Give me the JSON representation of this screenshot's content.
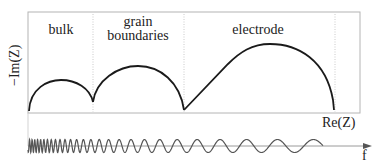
{
  "diagram": {
    "type": "impedance-spectrum-schematic",
    "axes": {
      "y_label": "−Im(Z)",
      "x_label": "Re(Z)",
      "frequency_label": "f"
    },
    "regions": [
      {
        "id": "bulk",
        "label": "bulk"
      },
      {
        "id": "grain-boundaries",
        "label_line1": "grain",
        "label_line2": "boundaries"
      },
      {
        "id": "electrode",
        "label": "electrode"
      }
    ],
    "colors": {
      "curve": "#1a1a1a",
      "frame": "#b4b4b4",
      "divider": "#bdbdbd",
      "wave": "#555555",
      "axis": "#9a9a9a"
    },
    "wave": {
      "description": "sinusoid with decreasing frequency from left to right along f axis"
    }
  }
}
